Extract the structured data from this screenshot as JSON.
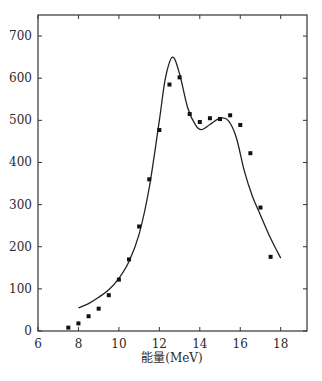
{
  "chart_data": {
    "type": "scatter",
    "title": "",
    "xlabel": "能量(MeV)",
    "ylabel": "",
    "xlim": [
      6,
      19.3
    ],
    "ylim": [
      0,
      750
    ],
    "x_ticks": [
      6,
      8,
      10,
      12,
      14,
      16,
      18
    ],
    "y_ticks": [
      0,
      100,
      200,
      300,
      400,
      500,
      600,
      700
    ],
    "grid": false,
    "legend": null,
    "series": [
      {
        "name": "measured",
        "kind": "scatter",
        "marker": "square",
        "x": [
          7.5,
          8.0,
          8.5,
          9.0,
          9.5,
          10.0,
          10.5,
          11.0,
          11.5,
          12.0,
          12.5,
          13.0,
          13.5,
          14.0,
          14.5,
          15.0,
          15.5,
          16.0,
          16.5,
          17.0,
          17.5
        ],
        "y": [
          8,
          18,
          35,
          53,
          85,
          122,
          170,
          248,
          360,
          477,
          585,
          602,
          515,
          496,
          505,
          503,
          512,
          489,
          422,
          293,
          176
        ]
      },
      {
        "name": "fit",
        "kind": "line",
        "x": [
          8.0,
          8.5,
          9.0,
          9.5,
          10.0,
          10.5,
          11.0,
          11.5,
          12.0,
          12.3,
          12.65,
          13.0,
          13.4,
          13.8,
          14.1,
          14.5,
          15.0,
          15.4,
          15.8,
          16.2,
          16.6,
          17.0,
          17.5,
          18.0
        ],
        "y": [
          55,
          65,
          80,
          98,
          125,
          165,
          230,
          340,
          500,
          600,
          650,
          610,
          530,
          488,
          478,
          490,
          505,
          500,
          460,
          380,
          320,
          275,
          220,
          173
        ]
      }
    ],
    "colors": {
      "axis": "#333333",
      "points": "#111111",
      "line": "#222222"
    }
  }
}
